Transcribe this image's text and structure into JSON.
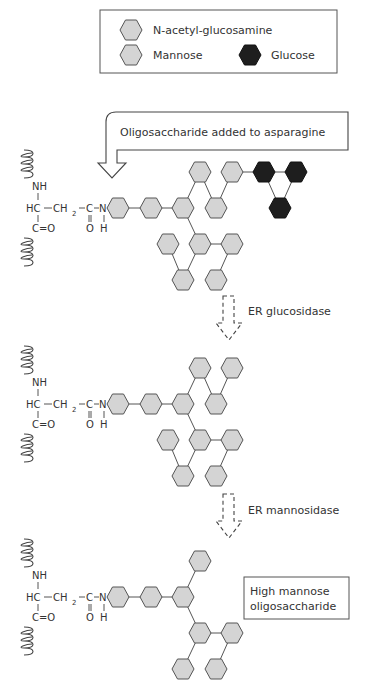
{
  "legend": {
    "items": [
      {
        "label": "N-acetyl-glucosamine",
        "color": "#d4d4d4"
      },
      {
        "label": "Mannose",
        "color": "#d4d4d4"
      },
      {
        "label": "Glucose",
        "color": "#1e1e1e"
      }
    ]
  },
  "callout": {
    "label": "Oligosaccharide added to asparagine"
  },
  "steps": [
    {
      "label": "ER glucosidase"
    },
    {
      "label": "ER mannosidase"
    }
  ],
  "result": {
    "line1": "High mannose",
    "line2": "oligosaccharide"
  },
  "asparagine": {
    "nh": "NH",
    "hc": "HC",
    "ch2": "CH",
    "sub2": "2",
    "c": "C",
    "n": "N",
    "co": "C=O",
    "o": "O",
    "h": "H"
  },
  "colors": {
    "mannose": "#d4d4d4",
    "glcnac": "#d4d4d4",
    "glucose": "#1e1e1e"
  }
}
